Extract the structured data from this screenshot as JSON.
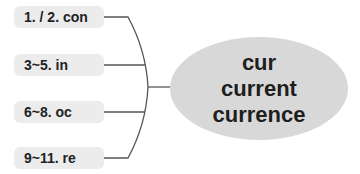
{
  "diagram": {
    "center": {
      "lines": [
        "cur",
        "current",
        "currence"
      ]
    },
    "branches": [
      {
        "label": "1. / 2. con"
      },
      {
        "label": "3~5. in"
      },
      {
        "label": "6~8. oc"
      },
      {
        "label": "9~11. re"
      }
    ],
    "colors": {
      "branch_fill": "#ececec",
      "center_fill": "#d8d8d8",
      "line": "#555555",
      "text": "#222222"
    }
  }
}
